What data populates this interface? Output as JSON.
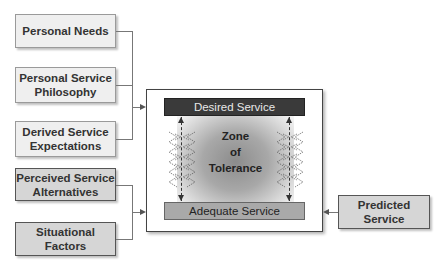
{
  "left_boxes": {
    "personal_needs": "Personal Needs",
    "personal_service_philosophy": [
      "Personal Service",
      "Philosophy"
    ],
    "derived_service_expectations": [
      "Derived Service",
      "Expectations"
    ],
    "perceived_service_alternatives": [
      "Perceived Service",
      "Alternatives"
    ],
    "situational_factors": [
      "Situational",
      "Factors"
    ]
  },
  "main": {
    "desired_service": "Desired Service",
    "adequate_service": "Adequate Service",
    "zone": [
      "Zone",
      "of",
      "Tolerance"
    ]
  },
  "right_box": {
    "predicted_service": [
      "Predicted",
      "Service"
    ]
  },
  "colors": {
    "desired_bar": "#3a3a3a",
    "adequate_bar": "#a9a9a9",
    "light_box": "#efefef",
    "dark_box": "#d6d6d6"
  }
}
